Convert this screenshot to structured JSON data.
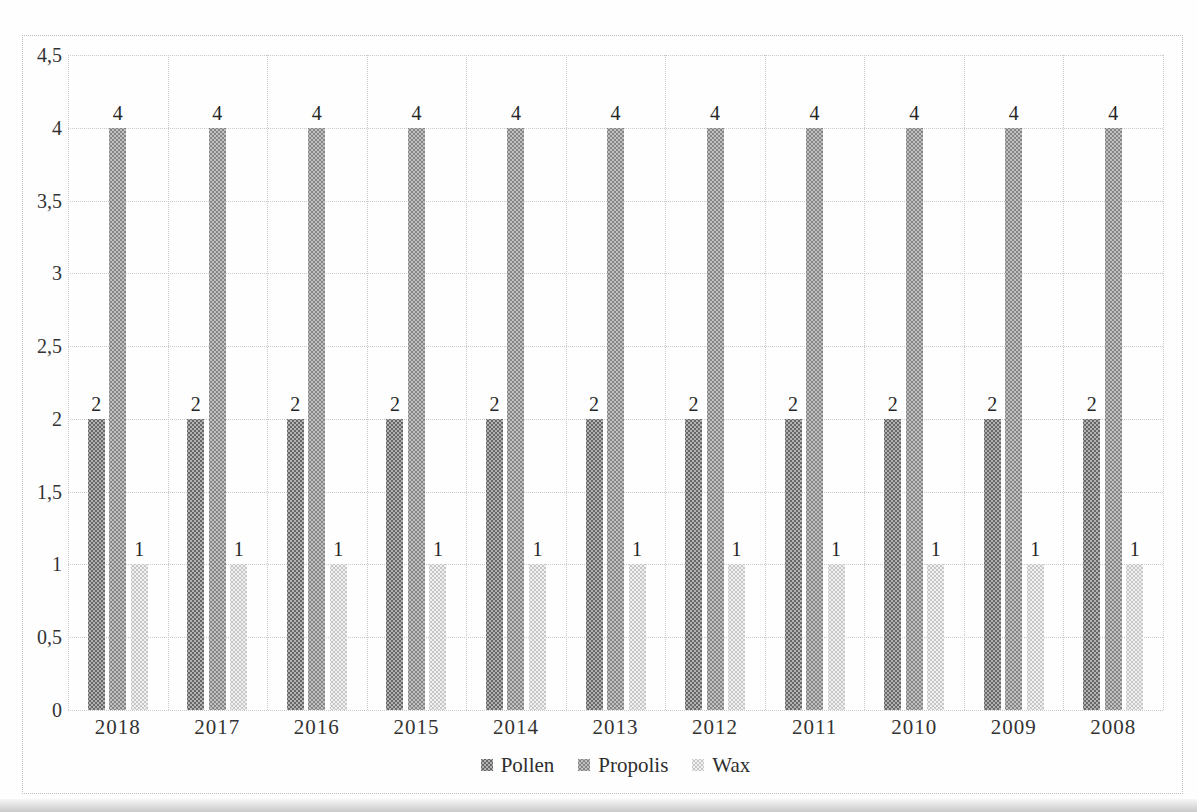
{
  "figure": {
    "background": "#fefefe",
    "border_color": "#bdbdbd",
    "text_color": "#2e2e2e"
  },
  "chart_data": {
    "type": "bar",
    "title": "",
    "xlabel": "",
    "ylabel": "",
    "categories": [
      "2018",
      "2017",
      "2016",
      "2015",
      "2014",
      "2013",
      "2012",
      "2011",
      "2010",
      "2009",
      "2008"
    ],
    "series": [
      {
        "name": "Pollen",
        "values": [
          2,
          2,
          2,
          2,
          2,
          2,
          2,
          2,
          2,
          2,
          2
        ],
        "color": "#8c8c8c"
      },
      {
        "name": "Propolis",
        "values": [
          4,
          4,
          4,
          4,
          4,
          4,
          4,
          4,
          4,
          4,
          4
        ],
        "color": "#a3a3a3"
      },
      {
        "name": "Wax",
        "values": [
          1,
          1,
          1,
          1,
          1,
          1,
          1,
          1,
          1,
          1,
          1
        ],
        "color": "#d8d8d8"
      }
    ],
    "ylim": [
      0,
      4.5
    ],
    "ytick_labels": [
      "0",
      "0,5",
      "1",
      "1,5",
      "2",
      "2,5",
      "3",
      "3,5",
      "4",
      "4,5"
    ],
    "decimal_separator": ",",
    "grid": true,
    "gridline_style": "dotted",
    "data_labels": true,
    "legend_position": "bottom",
    "legend_entries": [
      "Pollen",
      "Propolis",
      "Wax"
    ]
  }
}
